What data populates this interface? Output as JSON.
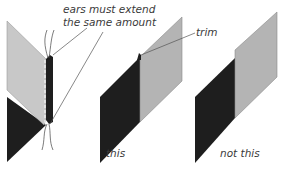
{
  "annotations": {
    "ears_line1": "ears must extend",
    "ears_line2": "the same amount",
    "trim": "trim"
  },
  "figures": [
    {
      "name": "seamed-panels-detail",
      "caption": ""
    },
    {
      "name": "correct-example",
      "caption": "this"
    },
    {
      "name": "incorrect-example",
      "caption": "not this"
    }
  ],
  "colors": {
    "dark_panel": "#1e1e1e",
    "light_panel": "#c8c8c8",
    "light_panel_alt": "#b4b4b4",
    "lines": "#555555",
    "text": "#3a3a3a"
  }
}
